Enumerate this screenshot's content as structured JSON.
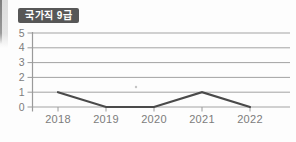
{
  "badge": {
    "label": "국가직 9급"
  },
  "chart_data": {
    "type": "line",
    "title": "국가직 9급",
    "categories": [
      "2018",
      "2019",
      "2020",
      "2021",
      "2022"
    ],
    "series": [
      {
        "name": "국가직 9급",
        "values": [
          1,
          0,
          0,
          1,
          0
        ]
      }
    ],
    "xlabel": "",
    "ylabel": "",
    "ylim": [
      0,
      5
    ],
    "yticks": [
      0,
      1,
      2,
      3,
      4,
      5
    ],
    "grid": "horizontal",
    "legend": "none",
    "colors": {
      "line": "#4a4a4a",
      "grid": "#a3a3a3",
      "axis": "#9a9a9a",
      "tick_label": "#7c7c7c",
      "badge_bg": "#575757",
      "badge_text": "#ffffff"
    }
  }
}
